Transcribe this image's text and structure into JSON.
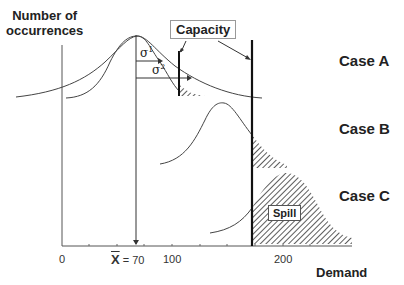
{
  "y_axis_label_line1": "Number of",
  "y_axis_label_line2": "occurrences",
  "x_axis_label": "Demand",
  "capacity_label": "Capacity",
  "spill_label": "Spill",
  "cases": [
    {
      "label": "Case A"
    },
    {
      "label": "Case B"
    },
    {
      "label": "Case C"
    }
  ],
  "x_ticks": [
    {
      "label": "0",
      "value": 0
    },
    {
      "label": "100",
      "value": 100
    },
    {
      "label": "200",
      "value": 200
    }
  ],
  "mean_label": "X̅ = 70",
  "mean_symbol": "X",
  "mean_value_text": "= 70",
  "sigma1_label": "σ",
  "sigma1_sup": "1",
  "sigma2_label": "σ",
  "sigma2_sup": "2",
  "colors": {
    "line": "#333333",
    "capacity_line": "#111111",
    "hatch": "#333333",
    "text": "#222222"
  }
}
